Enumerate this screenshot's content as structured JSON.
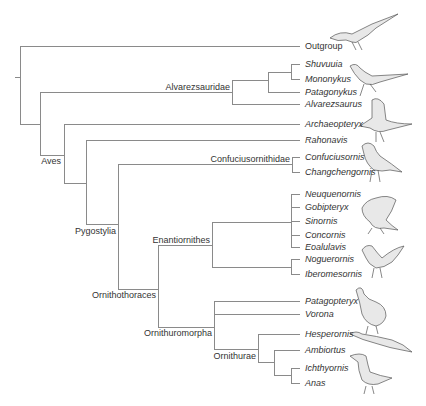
{
  "diagram": {
    "type": "phylogenetic-tree",
    "line_color": "#8a8a8a",
    "text_color": "#333333",
    "taxa": [
      {
        "id": "outgroup",
        "label": "Outgroup",
        "italic": false,
        "x": 305,
        "y": 46
      },
      {
        "id": "shuvuuia",
        "label": "Shuvuuia",
        "italic": true,
        "x": 305,
        "y": 64
      },
      {
        "id": "mononykus",
        "label": "Mononykus",
        "italic": true,
        "x": 305,
        "y": 79
      },
      {
        "id": "patagonykus",
        "label": "Patagonykus",
        "italic": true,
        "x": 305,
        "y": 92
      },
      {
        "id": "alvarezsaurus",
        "label": "Alvarezsaurus",
        "italic": true,
        "x": 305,
        "y": 104
      },
      {
        "id": "archaeopteryx",
        "label": "Archaeopteryx",
        "italic": true,
        "x": 305,
        "y": 124
      },
      {
        "id": "rahonavis",
        "label": "Rahonavis",
        "italic": true,
        "x": 305,
        "y": 140
      },
      {
        "id": "confuciusornis",
        "label": "Confuciusornis",
        "italic": true,
        "x": 305,
        "y": 157
      },
      {
        "id": "changchengornis",
        "label": "Changchengornis",
        "italic": true,
        "x": 305,
        "y": 172
      },
      {
        "id": "neuquenornis",
        "label": "Neuquenornis",
        "italic": true,
        "x": 305,
        "y": 194
      },
      {
        "id": "gobipteryx",
        "label": "Gobipteryx",
        "italic": true,
        "x": 305,
        "y": 207
      },
      {
        "id": "sinornis",
        "label": "Sinornis",
        "italic": true,
        "x": 305,
        "y": 221
      },
      {
        "id": "concornis",
        "label": "Concornis",
        "italic": true,
        "x": 305,
        "y": 235
      },
      {
        "id": "eoalulavis",
        "label": "Eoalulavis",
        "italic": true,
        "x": 305,
        "y": 247
      },
      {
        "id": "noguerornis",
        "label": "Noguerornis",
        "italic": true,
        "x": 305,
        "y": 259
      },
      {
        "id": "iberomesornis",
        "label": "Iberomesornis",
        "italic": true,
        "x": 305,
        "y": 274
      },
      {
        "id": "patagopteryx",
        "label": "Patagopteryx",
        "italic": true,
        "x": 305,
        "y": 301
      },
      {
        "id": "vorona",
        "label": "Vorona",
        "italic": true,
        "x": 305,
        "y": 314
      },
      {
        "id": "hesperornis",
        "label": "Hesperornis",
        "italic": true,
        "x": 305,
        "y": 334
      },
      {
        "id": "ambiortus",
        "label": "Ambiortus",
        "italic": true,
        "x": 305,
        "y": 350
      },
      {
        "id": "ichthyornis",
        "label": "Ichthyornis",
        "italic": true,
        "x": 305,
        "y": 368
      },
      {
        "id": "anas",
        "label": "Anas",
        "italic": true,
        "x": 305,
        "y": 383
      }
    ],
    "clades": [
      {
        "id": "alvarezsauridae",
        "label": "Alvarezsauridae",
        "right": 230,
        "y": 87
      },
      {
        "id": "aves",
        "label": "Aves",
        "right": 61,
        "y": 158
      },
      {
        "id": "confuciusornithidae",
        "label": "Confuciusornithidae",
        "right": 290,
        "y": 159
      },
      {
        "id": "pygostylia",
        "label": "Pygostylia",
        "right": 116,
        "y": 227
      },
      {
        "id": "enantiornithes",
        "label": "Enantiornithes",
        "right": 210,
        "y": 240
      },
      {
        "id": "ornithothoraces",
        "label": "Ornithothoraces",
        "right": 156,
        "y": 291
      },
      {
        "id": "ornithuromorpha",
        "label": "Ornithuromorpha",
        "right": 212,
        "y": 330
      },
      {
        "id": "ornithurae",
        "label": "Ornithurae",
        "right": 256,
        "y": 352
      }
    ],
    "illustrations": [
      {
        "id": "outgroup-dinosaur",
        "depicts": "theropod dinosaur",
        "x": 335,
        "y": 10
      },
      {
        "id": "alvarezsaurid",
        "depicts": "alvarezsaurid dinosaur",
        "x": 345,
        "y": 60
      },
      {
        "id": "archaeopteryx-bird",
        "depicts": "archaeopteryx",
        "x": 360,
        "y": 98
      },
      {
        "id": "confuciusornis-bird",
        "depicts": "confuciusornis",
        "x": 355,
        "y": 142
      },
      {
        "id": "enantiornithine-1",
        "depicts": "enantiornithine bird",
        "x": 355,
        "y": 192
      },
      {
        "id": "enantiornithine-2",
        "depicts": "enantiornithine bird",
        "x": 355,
        "y": 240
      },
      {
        "id": "patagopteryx-bird",
        "depicts": "patagopteryx flightless bird",
        "x": 350,
        "y": 282
      },
      {
        "id": "hesperornis-bird",
        "depicts": "hesperornis diving bird",
        "x": 350,
        "y": 330
      },
      {
        "id": "ichthyornis-bird",
        "depicts": "ichthyornis seabird",
        "x": 350,
        "y": 352
      }
    ]
  }
}
